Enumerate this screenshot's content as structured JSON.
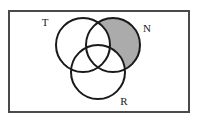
{
  "figure": {
    "type": "venn-diagram",
    "width": 197,
    "height": 122,
    "background_color": "#ffffff"
  },
  "frame": {
    "name": "universal-set-rectangle",
    "x": 8,
    "y": 10,
    "width": 182,
    "height": 103,
    "stroke_color": "#4a4a4a",
    "stroke_width": 2,
    "fill_color": "#ffffff"
  },
  "sets": [
    {
      "id": "T",
      "label": "T",
      "cx": 83,
      "cy": 45,
      "r": 27,
      "stroke_color": "#1a1a1a",
      "stroke_width": 2,
      "shaded": false,
      "label_x": 45,
      "label_y": 26
    },
    {
      "id": "N",
      "label": "N",
      "cx": 113,
      "cy": 45,
      "r": 27,
      "stroke_color": "#1a1a1a",
      "stroke_width": 2,
      "shaded": true,
      "label_x": 147,
      "label_y": 32
    },
    {
      "id": "R",
      "label": "R",
      "cx": 98,
      "cy": 72,
      "r": 27,
      "stroke_color": "#1a1a1a",
      "stroke_width": 2,
      "shaded": false,
      "label_x": 124,
      "label_y": 105
    }
  ],
  "shading": {
    "region_name": "N-only",
    "description": "N minus T minus R",
    "fill_color": "#ababab",
    "opacity": 1
  }
}
